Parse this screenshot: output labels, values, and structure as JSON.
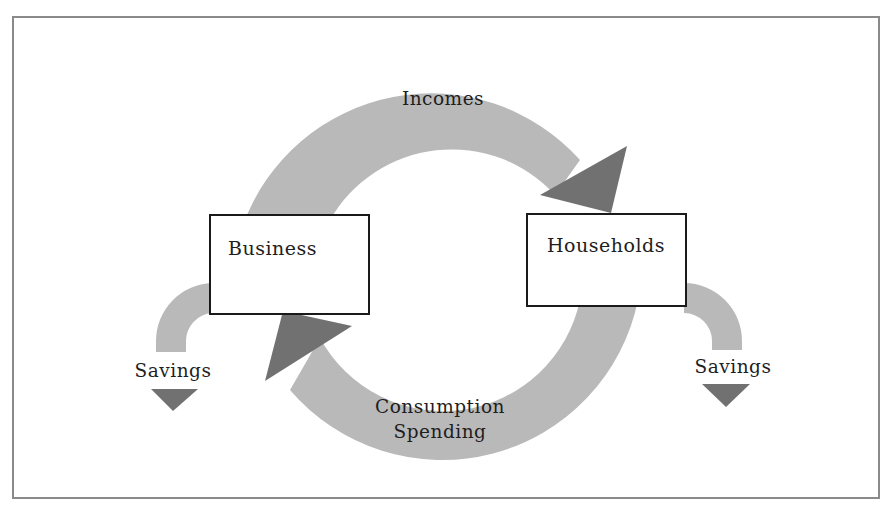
{
  "diagram": {
    "type": "circular-flow",
    "colors": {
      "flow_band": "#b9b9b9",
      "arrowhead": "#717171",
      "box_border": "#1a1a1a",
      "frame_border": "#8a8a8a",
      "text": "#1e1e1e"
    },
    "nodes": [
      {
        "id": "business",
        "label": "Business"
      },
      {
        "id": "households",
        "label": "Households"
      }
    ],
    "flows": [
      {
        "id": "incomes",
        "label": "Incomes",
        "from": "business",
        "to": "households"
      },
      {
        "id": "consumption",
        "label_line1": "Consumption",
        "label_line2": "Spending",
        "from": "households",
        "to": "business"
      }
    ],
    "leakages": [
      {
        "id": "business-savings",
        "label": "Savings",
        "from": "business"
      },
      {
        "id": "household-savings",
        "label": "Savings",
        "from": "households"
      }
    ]
  }
}
